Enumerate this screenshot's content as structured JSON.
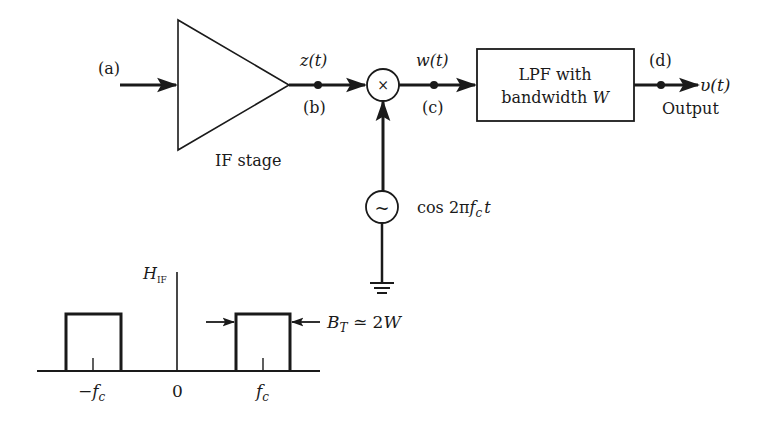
{
  "diagram": {
    "colors": {
      "stroke": "#1a1a1a",
      "background": "#ffffff"
    },
    "nodes": {
      "input_label": "(a)",
      "if_stage": {
        "label": "IF stage"
      },
      "node_b": {
        "signal": "z(t)",
        "label": "(b)"
      },
      "mixer": {
        "symbol": "×"
      },
      "node_c": {
        "signal": "w(t)",
        "label": "(c)"
      },
      "lpf": {
        "line1": "LPF with",
        "line2_prefix": "bandwidth ",
        "line2_var": "W"
      },
      "node_d": {
        "label": "(d)"
      },
      "output": {
        "signal": "υ(t)",
        "label": "Output"
      },
      "oscillator": {
        "symbol": "~",
        "label_prefix": "cos 2π",
        "label_f": "f",
        "label_sub": "c",
        "label_t": "t"
      },
      "ground": {
        "symbol": "ground-icon"
      }
    },
    "spectrum": {
      "axis_label": "H",
      "axis_sub": "IF",
      "tick_labels": {
        "neg": "−f",
        "neg_sub": "c",
        "zero": "0",
        "pos": "f",
        "pos_sub": "c"
      },
      "bandwidth_label": {
        "var": "B",
        "sub": "T",
        "rel": " ≃ 2",
        "w": "W"
      }
    }
  }
}
